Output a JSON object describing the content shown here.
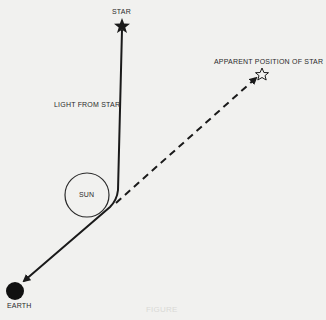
{
  "labels": {
    "star": "STAR",
    "apparent_star": "APPARENT POSITION OF STAR",
    "light_from_star": "LIGHT FROM STAR",
    "sun": "SUN",
    "earth": "EARTH",
    "caption": "FIGURE"
  },
  "colors": {
    "background": "#f1f1ef",
    "ink": "#1a1a1a"
  }
}
